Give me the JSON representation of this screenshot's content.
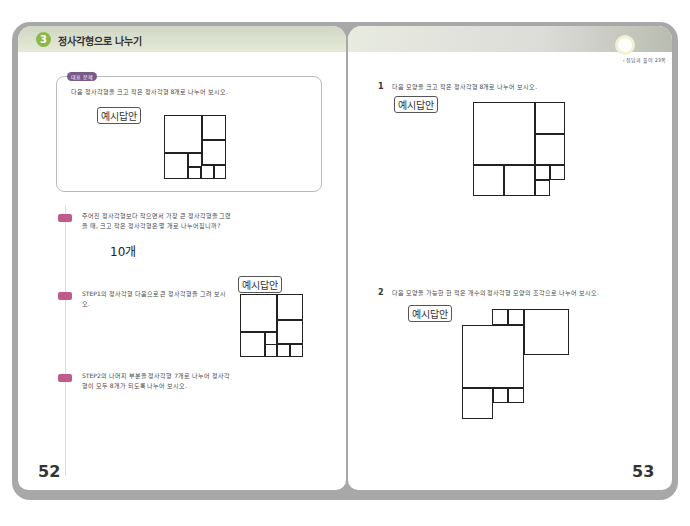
{
  "left_page": {
    "section_number": "3",
    "section_title": "정사각형으로 나누기",
    "example": {
      "tag": "대표 문제",
      "question": "다음 정사각형을 크고 작은 정사각형 8개로 나누어 보시오.",
      "answer_label": "예시답안"
    },
    "steps": [
      {
        "label": "STEP 1",
        "text": "주어진 정사각형보다 작으면서 가장 큰 정사각형을 그렸을 때, 크고 작은 정사각형은 몇 개로 나누어집니까?",
        "answer": "10개"
      },
      {
        "label": "STEP 2",
        "text": "STEP1의 정사각형 다음으로 큰 정사각형을 그려 보시오.",
        "answer_label": "예시답안"
      },
      {
        "label": "STEP 3",
        "text": "STEP2의 나머지 부분을 정사각형 7개로 나누어 정사각형이 모두 8개가 되도록 나누어 보시오."
      }
    ],
    "page_number": "52"
  },
  "right_page": {
    "reference": "› 정답과 풀이 23쪽",
    "problems": [
      {
        "number": "1",
        "text": "다음 모양을 크고 작은 정사각형 8개로 나누어 보시오.",
        "answer_label": "예시답안"
      },
      {
        "number": "2",
        "text": "다음 모양을 가능한 한 적은 개수의 정사각형 모양의 조각으로 나누어 보시오.",
        "answer_label": "예시답안"
      }
    ],
    "page_number": "53"
  }
}
